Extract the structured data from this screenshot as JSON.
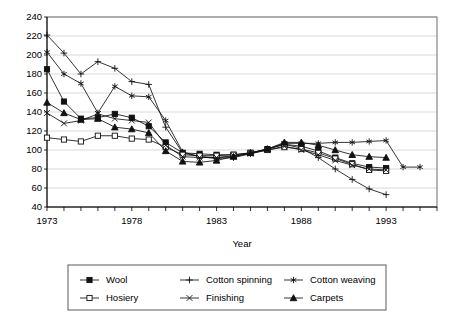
{
  "chart_data": {
    "type": "line",
    "title": "",
    "xlabel": "Year",
    "ylabel": "",
    "xlim": [
      1973,
      1996
    ],
    "ylim": [
      40,
      240
    ],
    "grid": true,
    "legend_position": "bottom",
    "x_tick_labels": [
      "1973",
      "1978",
      "1983",
      "1988",
      "1993"
    ],
    "x_tick_values": [
      1973,
      1978,
      1983,
      1988,
      1993
    ],
    "y_tick_labels": [
      "40",
      "60",
      "80",
      "100",
      "120",
      "140",
      "160",
      "180",
      "200",
      "220",
      "240"
    ],
    "y_tick_values": [
      40,
      60,
      80,
      100,
      120,
      140,
      160,
      180,
      200,
      220,
      240
    ],
    "x": [
      1973,
      1974,
      1975,
      1976,
      1977,
      1978,
      1979,
      1980,
      1981,
      1982,
      1983,
      1984,
      1985,
      1986,
      1987,
      1988,
      1989,
      1990,
      1991,
      1992,
      1993,
      1994,
      1995
    ],
    "series": [
      {
        "name": "Wool",
        "marker": "filled-square",
        "x": [
          1973,
          1974,
          1975,
          1976,
          1977,
          1978,
          1979,
          1980,
          1981,
          1982,
          1983,
          1984,
          1985,
          1986,
          1987,
          1988,
          1989,
          1990,
          1991,
          1992,
          1993
        ],
        "values": [
          185,
          151,
          133,
          134,
          138,
          134,
          125,
          108,
          97,
          96,
          95,
          95,
          97,
          101,
          106,
          104,
          99,
          92,
          86,
          82,
          81
        ]
      },
      {
        "name": "Cotton spinning",
        "marker": "plus",
        "x": [
          1973,
          1974,
          1975,
          1976,
          1977,
          1978,
          1979,
          1980,
          1981,
          1982,
          1983,
          1984,
          1985,
          1986,
          1987,
          1988,
          1989,
          1990,
          1991,
          1992,
          1993
        ],
        "values": [
          221,
          202,
          180,
          193,
          186,
          172,
          169,
          124,
          97,
          93,
          91,
          92,
          96,
          101,
          106,
          102,
          92,
          80,
          69,
          59,
          53
        ]
      },
      {
        "name": "Cotton weaving",
        "marker": "asterisk",
        "x": [
          1973,
          1974,
          1975,
          1976,
          1977,
          1978,
          1979,
          1980,
          1981,
          1982,
          1983,
          1984,
          1985,
          1986,
          1987,
          1988,
          1989,
          1990,
          1991,
          1992,
          1993,
          1994,
          1995
        ],
        "values": [
          203,
          180,
          170,
          139,
          167,
          157,
          156,
          131,
          98,
          93,
          92,
          93,
          97,
          101,
          107,
          107,
          107,
          108,
          108,
          109,
          110,
          82,
          82
        ]
      },
      {
        "name": "Hosiery",
        "marker": "open-square",
        "x": [
          1973,
          1974,
          1975,
          1976,
          1977,
          1978,
          1979,
          1980,
          1981,
          1982,
          1983,
          1984,
          1985,
          1986,
          1987,
          1988,
          1989,
          1990,
          1991,
          1992,
          1993
        ],
        "values": [
          113,
          111,
          109,
          115,
          115,
          112,
          111,
          103,
          95,
          94,
          94,
          95,
          97,
          100,
          103,
          101,
          97,
          91,
          85,
          79,
          78
        ]
      },
      {
        "name": "Finishing",
        "marker": "cross",
        "x": [
          1973,
          1974,
          1975,
          1976,
          1977,
          1978,
          1979,
          1980,
          1981,
          1982,
          1983,
          1984,
          1985,
          1986,
          1987,
          1988,
          1989,
          1990,
          1991,
          1992,
          1993
        ],
        "values": [
          139,
          128,
          131,
          138,
          133,
          131,
          129,
          105,
          93,
          92,
          92,
          94,
          96,
          100,
          104,
          100,
          95,
          89,
          84,
          80,
          79
        ]
      },
      {
        "name": "Carpets",
        "marker": "filled-triangle",
        "x": [
          1973,
          1974,
          1975,
          1976,
          1977,
          1978,
          1979,
          1980,
          1981,
          1982,
          1983,
          1984,
          1985,
          1986,
          1987,
          1988,
          1989,
          1990,
          1991,
          1992,
          1993
        ],
        "values": [
          150,
          139,
          132,
          133,
          124,
          122,
          118,
          99,
          88,
          87,
          89,
          93,
          97,
          101,
          108,
          108,
          105,
          100,
          95,
          93,
          92
        ]
      }
    ],
    "legend": [
      {
        "label": "Wool",
        "marker": "filled-square"
      },
      {
        "label": "Cotton spinning",
        "marker": "plus"
      },
      {
        "label": "Cotton weaving",
        "marker": "asterisk"
      },
      {
        "label": "Hosiery",
        "marker": "open-square"
      },
      {
        "label": "Finishing",
        "marker": "cross"
      },
      {
        "label": "Carpets",
        "marker": "filled-triangle"
      }
    ],
    "colors": {
      "line": "#111111",
      "grid": "#c9c9c9",
      "frame": "#6e6e6e",
      "text": "#000000"
    }
  }
}
